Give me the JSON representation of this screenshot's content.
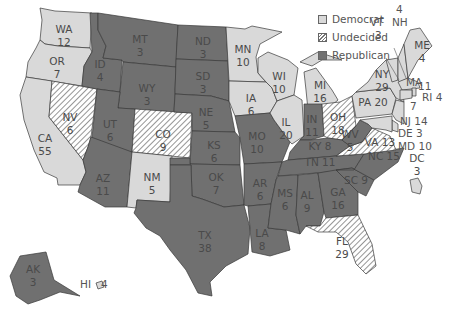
{
  "legend": [
    {
      "key": "dem",
      "label": "Democrat"
    },
    {
      "key": "und",
      "label": "Undecided"
    },
    {
      "key": "rep",
      "label": "Republican"
    }
  ],
  "colors": {
    "democrat": "#d9d9d9",
    "undecided": "#ffffff/#777777 hatch",
    "republican": "#707070"
  },
  "states": {
    "WA": {
      "abbr": "WA",
      "votes": "12",
      "status": "dem"
    },
    "OR": {
      "abbr": "OR",
      "votes": "7",
      "status": "dem"
    },
    "CA": {
      "abbr": "CA",
      "votes": "55",
      "status": "dem"
    },
    "NV": {
      "abbr": "NV",
      "votes": "6",
      "status": "und"
    },
    "ID": {
      "abbr": "ID",
      "votes": "4",
      "status": "rep"
    },
    "MT": {
      "abbr": "MT",
      "votes": "3",
      "status": "rep"
    },
    "WY": {
      "abbr": "WY",
      "votes": "3",
      "status": "rep"
    },
    "UT": {
      "abbr": "UT",
      "votes": "6",
      "status": "rep"
    },
    "AZ": {
      "abbr": "AZ",
      "votes": "11",
      "status": "rep"
    },
    "CO": {
      "abbr": "CO",
      "votes": "9",
      "status": "und"
    },
    "NM": {
      "abbr": "NM",
      "votes": "5",
      "status": "dem"
    },
    "ND": {
      "abbr": "ND",
      "votes": "3",
      "status": "rep"
    },
    "SD": {
      "abbr": "SD",
      "votes": "3",
      "status": "rep"
    },
    "NE": {
      "abbr": "NE",
      "votes": "5",
      "status": "rep"
    },
    "KS": {
      "abbr": "KS",
      "votes": "6",
      "status": "rep"
    },
    "OK": {
      "abbr": "OK",
      "votes": "7",
      "status": "rep"
    },
    "TX": {
      "abbr": "TX",
      "votes": "38",
      "status": "rep"
    },
    "MN": {
      "abbr": "MN",
      "votes": "10",
      "status": "dem"
    },
    "IA": {
      "abbr": "IA",
      "votes": "6",
      "status": "dem"
    },
    "MO": {
      "abbr": "MO",
      "votes": "10",
      "status": "rep"
    },
    "AR": {
      "abbr": "AR",
      "votes": "6",
      "status": "rep"
    },
    "LA": {
      "abbr": "LA",
      "votes": "8",
      "status": "rep"
    },
    "WI": {
      "abbr": "WI",
      "votes": "10",
      "status": "dem"
    },
    "IL": {
      "abbr": "IL",
      "votes": "20",
      "status": "dem"
    },
    "MI": {
      "abbr": "MI",
      "votes": "16",
      "status": "dem"
    },
    "IN": {
      "abbr": "IN",
      "votes": "11",
      "status": "rep"
    },
    "OH": {
      "abbr": "OH",
      "votes": "18",
      "status": "und"
    },
    "KY": {
      "abbr": "KY",
      "votes": "8",
      "status": "rep"
    },
    "TN": {
      "abbr": "TN",
      "votes": "11",
      "status": "rep"
    },
    "MS": {
      "abbr": "MS",
      "votes": "6",
      "status": "rep"
    },
    "AL": {
      "abbr": "AL",
      "votes": "9",
      "status": "rep"
    },
    "GA": {
      "abbr": "GA",
      "votes": "16",
      "status": "rep"
    },
    "FL": {
      "abbr": "FL",
      "votes": "29",
      "status": "und"
    },
    "SC": {
      "abbr": "SC",
      "votes": "9",
      "status": "rep"
    },
    "NC": {
      "abbr": "NC",
      "votes": "15",
      "status": "rep"
    },
    "VA": {
      "abbr": "VA",
      "votes": "13",
      "status": "und"
    },
    "WV": {
      "abbr": "WV",
      "votes": "5",
      "status": "rep"
    },
    "PA": {
      "abbr": "PA",
      "votes": "20",
      "status": "dem"
    },
    "NY": {
      "abbr": "NY",
      "votes": "29",
      "status": "dem"
    },
    "VT": {
      "abbr": "VT",
      "votes": "3",
      "status": "dem"
    },
    "NH": {
      "abbr": "NH",
      "votes": "4",
      "status": "dem"
    },
    "ME": {
      "abbr": "ME",
      "votes": "4",
      "status": "dem"
    },
    "MA": {
      "abbr": "MA",
      "votes": "11",
      "status": "dem"
    },
    "RI": {
      "abbr": "RI",
      "votes": "4",
      "status": "dem"
    },
    "CT": {
      "abbr": "CT",
      "votes": "7",
      "status": "dem"
    },
    "NJ": {
      "abbr": "NJ",
      "votes": "14",
      "status": "dem"
    },
    "DE": {
      "abbr": "DE",
      "votes": "3",
      "status": "dem"
    },
    "MD": {
      "abbr": "MD",
      "votes": "10",
      "status": "dem"
    },
    "DC": {
      "abbr": "DC",
      "votes": "3",
      "status": "dem"
    },
    "AK": {
      "abbr": "AK",
      "votes": "3",
      "status": "rep"
    },
    "HI": {
      "abbr": "HI",
      "votes": "4",
      "status": "dem"
    }
  }
}
